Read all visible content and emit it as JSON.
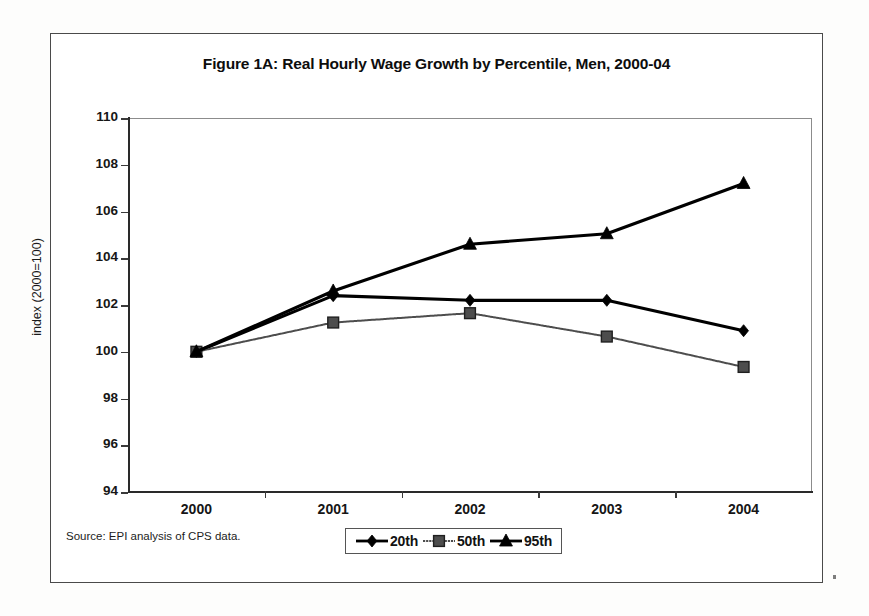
{
  "figure": {
    "title": "Figure 1A: Real Hourly Wage Growth by Percentile, Men, 2000-04",
    "source_note": "Source: EPI analysis of CPS data."
  },
  "axes": {
    "y_title": "index (2000=100)",
    "y_ticks": [
      "110",
      "108",
      "106",
      "104",
      "102",
      "100",
      "98",
      "96",
      "94"
    ],
    "x_ticks": [
      "2000",
      "2001",
      "2002",
      "2003",
      "2004"
    ]
  },
  "legend": {
    "items": [
      {
        "label": "20th",
        "marker": "diamond-marker",
        "color": "#000000"
      },
      {
        "label": "50th",
        "marker": "square-marker",
        "color": "#4d4d4d"
      },
      {
        "label": "95th",
        "marker": "triangle-marker",
        "color": "#000000"
      }
    ]
  },
  "chart_data": {
    "type": "line",
    "title": "Figure 1A: Real Hourly Wage Growth by Percentile, Men, 2000-04",
    "xlabel": "",
    "ylabel": "index (2000=100)",
    "x": [
      2000,
      2001,
      2002,
      2003,
      2004
    ],
    "categories": [
      "2000",
      "2001",
      "2002",
      "2003",
      "2004"
    ],
    "ylim": [
      94,
      110
    ],
    "ytick_step": 2,
    "grid": false,
    "legend_position": "bottom-center",
    "series": [
      {
        "name": "20th",
        "marker": "diamond",
        "color": "#000000",
        "values": [
          100.0,
          102.4,
          102.2,
          102.2,
          100.9
        ]
      },
      {
        "name": "50th",
        "marker": "square",
        "color": "#4d4d4d",
        "values": [
          100.0,
          101.25,
          101.65,
          100.65,
          99.35
        ]
      },
      {
        "name": "95th",
        "marker": "triangle",
        "color": "#000000",
        "values": [
          100.0,
          102.6,
          104.6,
          105.05,
          107.2
        ]
      }
    ]
  }
}
